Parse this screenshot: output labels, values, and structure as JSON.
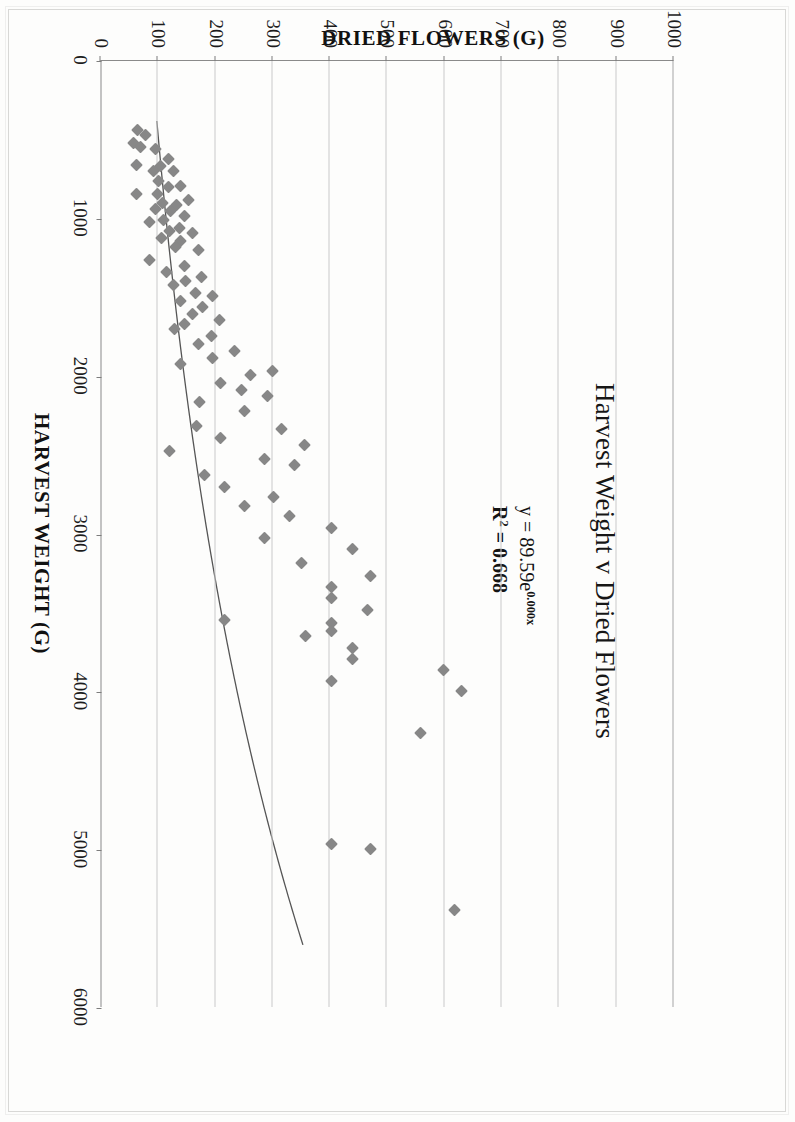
{
  "chart_data": {
    "type": "scatter",
    "title": "Harvest Weight v Dried Flowers",
    "xlabel": "HARVEST WEIGHT (G)",
    "ylabel": "DRIED FLOWERS (G)",
    "xlim": [
      0,
      6000
    ],
    "ylim": [
      0,
      1000
    ],
    "xticks": [
      0,
      1000,
      2000,
      3000,
      4000,
      5000,
      6000
    ],
    "yticks": [
      0,
      100,
      200,
      300,
      400,
      500,
      600,
      700,
      800,
      900,
      1000
    ],
    "grid": "vertical-and-top",
    "legend": "none",
    "marker_shape": "diamond",
    "marker_color": "#878787",
    "trendline": {
      "type": "exponential",
      "equation": "y = 89.59e",
      "equation_exponent": "0.000x",
      "r_squared_label": "R",
      "r_squared_sup": "2",
      "r_squared_value": "= 0.668",
      "coefficient": 89.59,
      "rate": 0.000245,
      "r2": 0.668,
      "color": "#555555"
    },
    "series": [
      {
        "name": "Harvest Weight v Dried Flowers",
        "points": [
          [
            440,
            65
          ],
          [
            470,
            78
          ],
          [
            520,
            57
          ],
          [
            545,
            70
          ],
          [
            560,
            96
          ],
          [
            620,
            118
          ],
          [
            660,
            63
          ],
          [
            665,
            105
          ],
          [
            700,
            92
          ],
          [
            700,
            128
          ],
          [
            760,
            101
          ],
          [
            790,
            139
          ],
          [
            800,
            118
          ],
          [
            840,
            62
          ],
          [
            845,
            100
          ],
          [
            880,
            153
          ],
          [
            900,
            108
          ],
          [
            915,
            133
          ],
          [
            935,
            96
          ],
          [
            950,
            123
          ],
          [
            985,
            146
          ],
          [
            1010,
            110
          ],
          [
            1020,
            86
          ],
          [
            1060,
            137
          ],
          [
            1080,
            120
          ],
          [
            1090,
            160
          ],
          [
            1120,
            106
          ],
          [
            1140,
            140
          ],
          [
            1180,
            131
          ],
          [
            1200,
            171
          ],
          [
            1260,
            85
          ],
          [
            1300,
            147
          ],
          [
            1340,
            116
          ],
          [
            1370,
            176
          ],
          [
            1395,
            149
          ],
          [
            1420,
            128
          ],
          [
            1470,
            165
          ],
          [
            1490,
            196
          ],
          [
            1520,
            140
          ],
          [
            1560,
            178
          ],
          [
            1600,
            160
          ],
          [
            1640,
            208
          ],
          [
            1665,
            147
          ],
          [
            1700,
            130
          ],
          [
            1740,
            193
          ],
          [
            1790,
            171
          ],
          [
            1840,
            233
          ],
          [
            1880,
            196
          ],
          [
            1920,
            140
          ],
          [
            1965,
            300
          ],
          [
            1990,
            262
          ],
          [
            2040,
            210
          ],
          [
            2085,
            246
          ],
          [
            2120,
            291
          ],
          [
            2160,
            173
          ],
          [
            2220,
            252
          ],
          [
            2310,
            167
          ],
          [
            2330,
            316
          ],
          [
            2390,
            210
          ],
          [
            2430,
            356
          ],
          [
            2470,
            120
          ],
          [
            2520,
            286
          ],
          [
            2560,
            338
          ],
          [
            2620,
            182
          ],
          [
            2700,
            216
          ],
          [
            2760,
            302
          ],
          [
            2820,
            252
          ],
          [
            2880,
            330
          ],
          [
            2960,
            404
          ],
          [
            3020,
            286
          ],
          [
            3090,
            439
          ],
          [
            3180,
            351
          ],
          [
            3260,
            472
          ],
          [
            3330,
            404
          ],
          [
            3400,
            404
          ],
          [
            3480,
            466
          ],
          [
            3540,
            216
          ],
          [
            3560,
            404
          ],
          [
            3610,
            404
          ],
          [
            3640,
            358
          ],
          [
            3720,
            440
          ],
          [
            3790,
            440
          ],
          [
            3860,
            599
          ],
          [
            3930,
            404
          ],
          [
            3990,
            630
          ],
          [
            4260,
            558
          ],
          [
            4960,
            404
          ],
          [
            4990,
            472
          ],
          [
            5380,
            617
          ]
        ]
      }
    ]
  },
  "annotations": {
    "equation_line1_pre": "y = 89.59e",
    "equation_line1_sup": "0.000x",
    "equation_line2_pre": "R",
    "equation_line2_sup": "2",
    "equation_line2_post": " = 0.668"
  }
}
